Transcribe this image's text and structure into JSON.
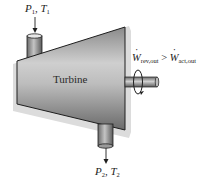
{
  "diagram": {
    "component_label": "Turbine",
    "inlet": {
      "pressure_symbol": "P",
      "pressure_sub": "1",
      "temperature_symbol": "T",
      "temperature_sub": "1",
      "separator": ","
    },
    "outlet": {
      "pressure_symbol": "P",
      "pressure_sub": "2",
      "temperature_symbol": "T",
      "temperature_sub": "2",
      "separator": ","
    },
    "work_relation": {
      "left_symbol": "W",
      "left_sub": "rev,out",
      "operator": ">",
      "right_symbol": "W",
      "right_sub": "act,out"
    },
    "colors": {
      "body_light": "#c8c8c8",
      "body_dark": "#6e6e6e",
      "outline": "#1e1e1e",
      "shadow": "#d9d9d9"
    }
  }
}
